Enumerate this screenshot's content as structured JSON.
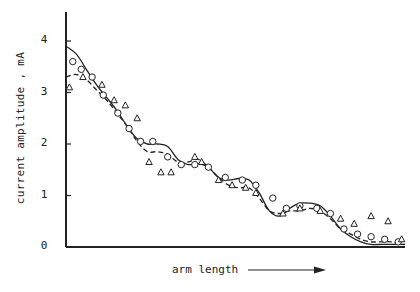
{
  "chart_data": {
    "type": "line",
    "title": "",
    "xlabel": "arm length",
    "ylabel": "current amplitude , mA",
    "xlim": [
      0,
      100
    ],
    "ylim": [
      0,
      4.5
    ],
    "yticks": [
      0,
      1,
      2,
      3,
      4
    ],
    "xticks": [],
    "grid": false,
    "legend": null,
    "x_units": "arbitrary (no tick labels shown)",
    "series": [
      {
        "name": "theory (solid)",
        "style": "solid",
        "x": [
          0,
          3,
          6,
          9,
          12,
          15,
          18,
          21,
          24,
          27,
          30,
          33,
          36,
          39,
          42,
          45,
          48,
          51,
          54,
          57,
          60,
          63,
          66,
          69,
          72,
          75,
          78,
          81,
          84,
          87,
          90,
          93,
          96,
          99,
          100
        ],
        "y": [
          3.9,
          3.75,
          3.45,
          3.15,
          2.9,
          2.65,
          2.35,
          2.1,
          2.0,
          2.0,
          1.95,
          1.7,
          1.6,
          1.62,
          1.55,
          1.35,
          1.3,
          1.33,
          1.3,
          1.05,
          0.7,
          0.6,
          0.75,
          0.85,
          0.85,
          0.8,
          0.6,
          0.35,
          0.2,
          0.1,
          0.05,
          0.05,
          0.05,
          0.05,
          0.05
        ]
      },
      {
        "name": "theory (dashed)",
        "style": "dashed",
        "x": [
          0,
          3,
          6,
          9,
          12,
          15,
          18,
          21,
          24,
          27,
          30,
          33,
          36,
          39,
          42,
          45,
          48,
          51,
          54,
          57,
          60,
          63,
          66,
          69,
          72,
          75,
          78,
          81,
          84,
          87,
          90,
          93,
          96,
          99,
          100
        ],
        "y": [
          3.3,
          3.35,
          3.25,
          3.05,
          2.85,
          2.6,
          2.35,
          2.05,
          1.85,
          1.85,
          1.8,
          1.65,
          1.65,
          1.7,
          1.55,
          1.35,
          1.2,
          1.15,
          1.15,
          0.95,
          0.7,
          0.65,
          0.7,
          0.7,
          0.75,
          0.7,
          0.55,
          0.35,
          0.25,
          0.15,
          0.1,
          0.1,
          0.1,
          0.05,
          0.05
        ]
      },
      {
        "name": "measured (circles)",
        "style": "marker-circle",
        "x": [
          2,
          4.5,
          7.7,
          11,
          15.3,
          18.6,
          22,
          25.6,
          30,
          34,
          38,
          42,
          47,
          52,
          56,
          61,
          65,
          69,
          74,
          78,
          82,
          86,
          90,
          94,
          98
        ],
        "y": [
          3.6,
          3.45,
          3.3,
          2.95,
          2.6,
          2.3,
          2.05,
          2.05,
          1.75,
          1.6,
          1.6,
          1.55,
          1.35,
          1.3,
          1.2,
          0.95,
          0.75,
          0.8,
          0.75,
          0.65,
          0.35,
          0.25,
          0.2,
          0.15,
          0.1
        ]
      },
      {
        "name": "measured (triangles)",
        "style": "marker-triangle",
        "x": [
          1,
          5,
          10.6,
          14.2,
          17.5,
          21,
          24.5,
          28,
          31,
          38,
          40,
          45,
          49,
          53,
          56,
          64,
          69,
          75,
          81,
          85,
          90,
          95,
          99
        ],
        "y": [
          3.1,
          3.3,
          3.15,
          2.85,
          2.75,
          2.5,
          1.65,
          1.45,
          1.45,
          1.75,
          1.65,
          1.3,
          1.2,
          1.15,
          1.05,
          0.65,
          0.75,
          0.7,
          0.55,
          0.45,
          0.6,
          0.5,
          0.15
        ]
      }
    ]
  },
  "axes": {
    "y_ticks": [
      "0",
      "1",
      "2",
      "3",
      "4"
    ],
    "x_label": "arm length",
    "y_label": "current amplitude , mA"
  }
}
